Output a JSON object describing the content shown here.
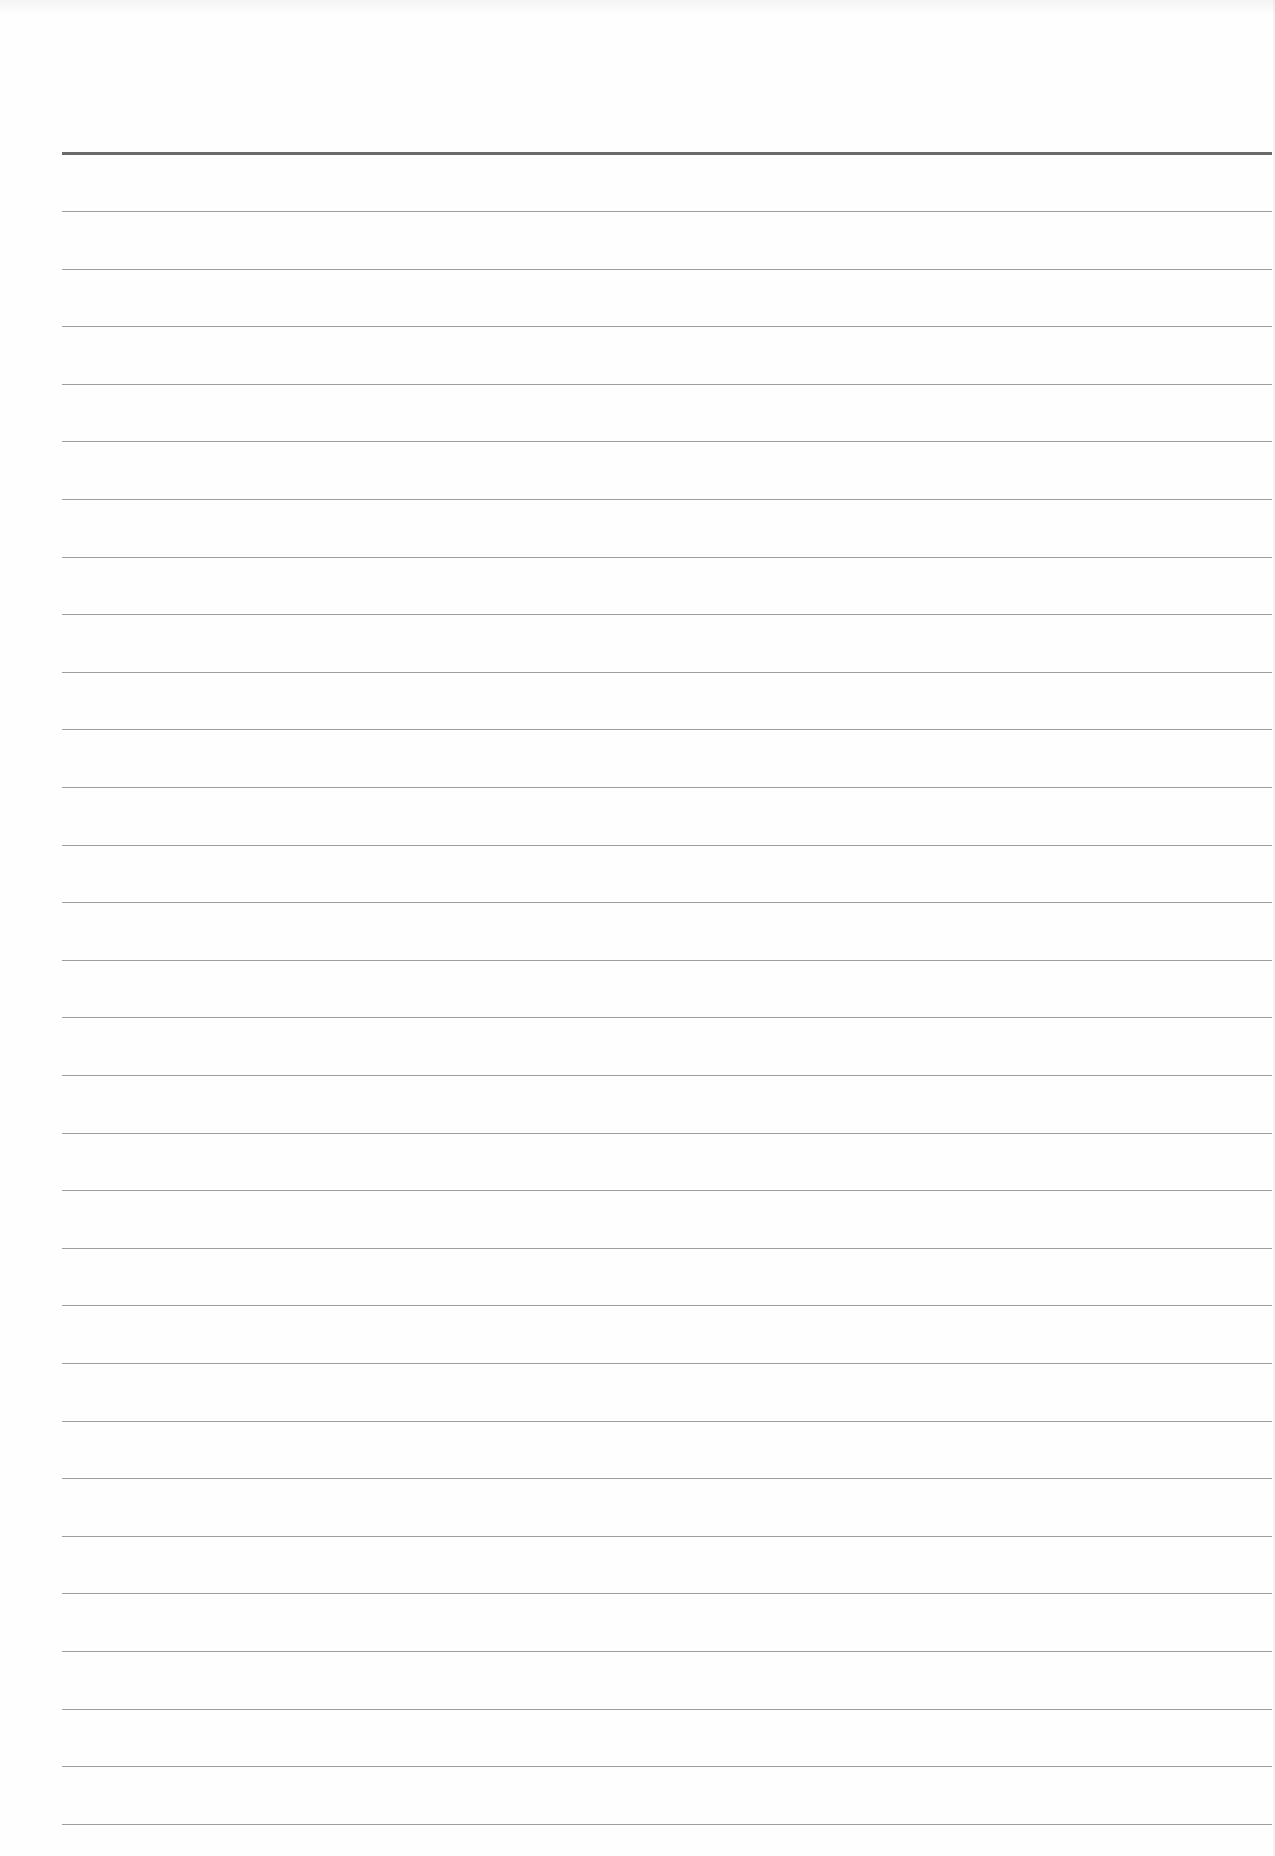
{
  "page": {
    "type": "ruled-notebook-page",
    "width": 1275,
    "height": 1856,
    "background": "#fefefe",
    "content_text": ""
  },
  "rules": {
    "left": 62,
    "right": 1272,
    "heavy": {
      "y": 152,
      "thickness": 3,
      "color": "#6a6a6a"
    },
    "thin": {
      "first_y": 211,
      "spacing": 57.6,
      "count": 29,
      "thickness": 1,
      "color": "#8c8c8c"
    }
  }
}
